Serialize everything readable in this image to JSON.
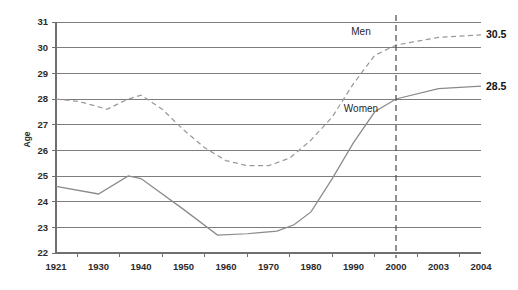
{
  "chart_data": {
    "type": "line",
    "title": "",
    "subtitle": "",
    "xlabel": "",
    "ylabel": "Age",
    "ylim": [
      22,
      31
    ],
    "yticks": [
      22,
      23,
      24,
      25,
      26,
      27,
      28,
      29,
      30,
      31
    ],
    "ytick_labels": [
      "22",
      "23",
      "24",
      "25",
      "26",
      "27",
      "28",
      "29",
      "30",
      "31"
    ],
    "grid": true,
    "grid_axis": "y",
    "legend": "inline-annotations",
    "xlim": [
      1921,
      2004
    ],
    "xtick_labels": [
      "1921",
      "1930",
      "1940",
      "1950",
      "1960",
      "1970",
      "1980",
      "1990",
      "2000",
      "2003",
      "2004"
    ],
    "xticks": [
      1921,
      1930,
      1940,
      1950,
      1960,
      1970,
      1980,
      1990,
      2000,
      2003,
      2004
    ],
    "annotations": [
      {
        "text": "Men",
        "series": "Men",
        "x": 1996,
        "y": 30.6
      },
      {
        "text": "Women",
        "series": "Women",
        "x": 1996,
        "y": 27.6
      },
      {
        "text": "30.5",
        "series": "Men",
        "x": 2004,
        "y": 30.5,
        "bold": true
      },
      {
        "text": "28.5",
        "series": "Women",
        "x": 2004,
        "y": 28.5,
        "bold": true
      }
    ],
    "reference_line": {
      "x": 2000,
      "style": "dashed",
      "label": ""
    },
    "series": [
      {
        "name": "Men",
        "style": "dashed",
        "color": "#9a9a9a",
        "x": [
          1921,
          1926,
          1932,
          1937,
          1940,
          1945,
          1950,
          1955,
          1960,
          1965,
          1970,
          1975,
          1980,
          1985,
          1990,
          1995,
          2000,
          2003,
          2004
        ],
        "values": [
          28.0,
          27.9,
          27.6,
          28.0,
          28.15,
          27.6,
          26.8,
          26.1,
          25.6,
          25.4,
          25.4,
          25.7,
          26.4,
          27.3,
          28.6,
          29.7,
          30.1,
          30.4,
          30.5
        ]
      },
      {
        "name": "Women",
        "style": "solid",
        "color": "#8a8a8a",
        "x": [
          1921,
          1930,
          1937,
          1940,
          1950,
          1958,
          1965,
          1972,
          1976,
          1980,
          1985,
          1990,
          1995,
          2000,
          2003,
          2004
        ],
        "values": [
          24.6,
          24.3,
          25.0,
          24.9,
          23.7,
          22.7,
          22.75,
          22.85,
          23.1,
          23.6,
          24.9,
          26.3,
          27.5,
          28.0,
          28.4,
          28.5
        ]
      }
    ]
  },
  "axis": {
    "y_title": "Age"
  }
}
